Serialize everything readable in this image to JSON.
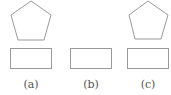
{
  "figures": [
    {
      "id": "a",
      "label": "(a)",
      "shapes": [
        "pentagon",
        "rectangle"
      ]
    },
    {
      "id": "b",
      "label": "(b)",
      "shapes": [
        "rectangle"
      ]
    },
    {
      "id": "c",
      "label": "(c)",
      "shapes": [
        "pentagon",
        "rectangle"
      ]
    }
  ],
  "colors": {
    "stroke": "#9a9a9a",
    "background": "#ffffff"
  }
}
